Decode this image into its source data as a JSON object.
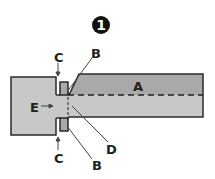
{
  "figure": {
    "step_number": "1",
    "labels": {
      "A": "A",
      "B_top": "B",
      "B_bottom": "B",
      "C_top": "C",
      "C_bottom": "C",
      "D": "D",
      "E": "E"
    },
    "colors": {
      "fill_light": "#c8c8c8",
      "fill_dark": "#a9a9a9",
      "outline": "#2a2a2a",
      "badge": "#111111"
    }
  }
}
